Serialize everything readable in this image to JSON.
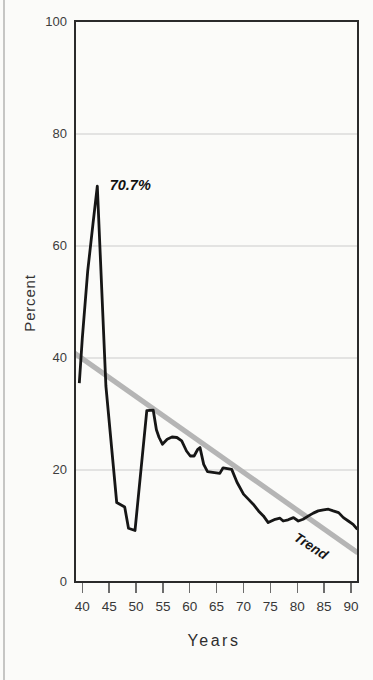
{
  "page": {
    "background": "#fbfbf9",
    "edge_line_color": "#c6c6c4"
  },
  "chart_data": {
    "type": "line",
    "title": "",
    "xlabel": "Years",
    "ylabel": "Percent",
    "xlim": [
      38.455,
      91.5
    ],
    "ylim": [
      0,
      100
    ],
    "x_ticks": [
      40,
      45,
      50,
      55,
      60,
      65,
      70,
      75,
      80,
      85,
      90
    ],
    "y_ticks": [
      0,
      20,
      40,
      60,
      80,
      100
    ],
    "grid": "horizontal",
    "legend": "none",
    "series": [
      {
        "name": "Percent",
        "color": "#161616",
        "width": 2.8,
        "points": [
          [
            39.45,
            35.5
          ],
          [
            40,
            43.5
          ],
          [
            41,
            55.5
          ],
          [
            42,
            64
          ],
          [
            42.8,
            70.7
          ],
          [
            44.4,
            35
          ],
          [
            46.4,
            14.2
          ],
          [
            47.9,
            13.4
          ],
          [
            48.6,
            9.6
          ],
          [
            49.8,
            9.2
          ],
          [
            52.0,
            30.6
          ],
          [
            53.2,
            30.7
          ],
          [
            53.8,
            27.2
          ],
          [
            54.3,
            25.8
          ],
          [
            54.9,
            24.6
          ],
          [
            55.8,
            25.5
          ],
          [
            56.7,
            25.9
          ],
          [
            57.6,
            25.8
          ],
          [
            58.5,
            25.2
          ],
          [
            59.4,
            23.4
          ],
          [
            60.1,
            22.5
          ],
          [
            60.8,
            22.5
          ],
          [
            61.5,
            23.7
          ],
          [
            61.9,
            24.0
          ],
          [
            62.6,
            21.0
          ],
          [
            63.3,
            19.7
          ],
          [
            65.6,
            19.4
          ],
          [
            66.2,
            20.4
          ],
          [
            67.8,
            20.1
          ],
          [
            68.8,
            17.8
          ],
          [
            70.0,
            15.7
          ],
          [
            70.9,
            14.8
          ],
          [
            71.8,
            13.9
          ],
          [
            72.8,
            12.7
          ],
          [
            73.7,
            11.8
          ],
          [
            74.6,
            10.6
          ],
          [
            75.9,
            11.2
          ],
          [
            76.8,
            11.4
          ],
          [
            77.4,
            10.9
          ],
          [
            78.3,
            11.1
          ],
          [
            79.3,
            11.5
          ],
          [
            80.2,
            10.9
          ],
          [
            81.1,
            11.2
          ],
          [
            82.1,
            11.8
          ],
          [
            83.0,
            12.3
          ],
          [
            83.9,
            12.7
          ],
          [
            84.9,
            12.9
          ],
          [
            85.8,
            13.0
          ],
          [
            86.7,
            12.7
          ],
          [
            87.7,
            12.4
          ],
          [
            88.6,
            11.5
          ],
          [
            89.5,
            10.9
          ],
          [
            90.4,
            10.3
          ],
          [
            91.2,
            9.4
          ]
        ]
      },
      {
        "name": "Trend",
        "color": "#b5b5b5",
        "width": 5.2,
        "points": [
          [
            38.5,
            40.9
          ],
          [
            91.3,
            5.2
          ]
        ]
      }
    ],
    "annotations": [
      {
        "text": "70.7%",
        "x": 45.1,
        "y": 70.9,
        "style": "bold-italic",
        "rotation": 0
      },
      {
        "text": "Trend",
        "x": 82.56,
        "y": 6.43,
        "style": "bold-italic",
        "rotation": 33
      }
    ],
    "axis_colors": {
      "border": "#2b2b2b",
      "gridline": "#cbcbcb",
      "tick": "#6d6d6d",
      "tick_label": "#3d3d3d"
    }
  }
}
